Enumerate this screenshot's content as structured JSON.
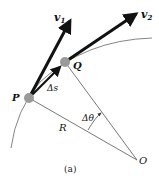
{
  "figure": {
    "caption": "(a)",
    "colors": {
      "arrow": "#111111",
      "line": "#555555",
      "arc": "#777777",
      "point_fill": "#9a9a9a",
      "background": "#ffffff"
    },
    "points": {
      "P": {
        "label": "P",
        "x": 29,
        "y": 98
      },
      "Q": {
        "label": "Q",
        "x": 65,
        "y": 62
      },
      "O": {
        "label": "O",
        "x": 137,
        "y": 160
      }
    },
    "vectors": {
      "v1": {
        "name": "v",
        "subscript": "1"
      },
      "v2": {
        "name": "v",
        "subscript": "2"
      },
      "ds": {
        "label": "Δs"
      }
    },
    "labels": {
      "radius": "R",
      "angle": "Δθ"
    }
  }
}
